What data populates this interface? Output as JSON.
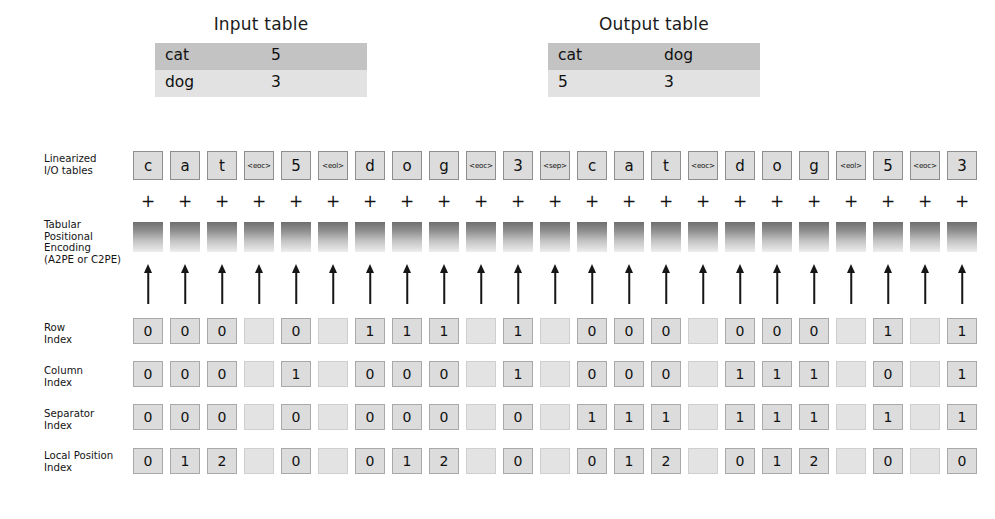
{
  "input_table": {
    "caption": "Input table",
    "header": [
      "cat",
      "5"
    ],
    "rows": [
      [
        "dog",
        "3"
      ]
    ]
  },
  "output_table": {
    "caption": "Output table",
    "header": [
      "cat",
      "dog"
    ],
    "rows": [
      [
        "5",
        "3"
      ]
    ]
  },
  "labels": {
    "linearized": "Linearized\nI/O tables",
    "tpe": "Tabular\nPositional\nEncoding\n(A2PE or C2PE)",
    "row_index": "Row\nIndex",
    "column_index": "Column\nIndex",
    "separator_index": "Separator\nIndex",
    "local_position_index": "Local Position\nIndex"
  },
  "plus_symbol": "+",
  "tokens": [
    "c",
    "a",
    "t",
    "<eoc>",
    "5",
    "<eol>",
    "d",
    "o",
    "g",
    "<eoc>",
    "3",
    "<sep>",
    "c",
    "a",
    "t",
    "<eoc>",
    "d",
    "o",
    "g",
    "<eol>",
    "5",
    "<eoc>",
    "3"
  ],
  "special_tokens": [
    "<eoc>",
    "<eol>",
    "<sep>"
  ],
  "row_index": [
    "0",
    "0",
    "0",
    "",
    "0",
    "",
    "1",
    "1",
    "1",
    "",
    "1",
    "",
    "0",
    "0",
    "0",
    "",
    "0",
    "0",
    "0",
    "",
    "1",
    "",
    "1"
  ],
  "column_index": [
    "0",
    "0",
    "0",
    "",
    "1",
    "",
    "0",
    "0",
    "0",
    "",
    "1",
    "",
    "0",
    "0",
    "0",
    "",
    "1",
    "1",
    "1",
    "",
    "0",
    "",
    "1"
  ],
  "separator_index": [
    "0",
    "0",
    "0",
    "",
    "0",
    "",
    "0",
    "0",
    "0",
    "",
    "0",
    "",
    "1",
    "1",
    "1",
    "",
    "1",
    "1",
    "1",
    "",
    "1",
    "",
    "1"
  ],
  "local_position_index": [
    "0",
    "1",
    "2",
    "",
    "0",
    "",
    "0",
    "1",
    "2",
    "",
    "0",
    "",
    "0",
    "1",
    "2",
    "",
    "0",
    "1",
    "2",
    "",
    "0",
    "",
    "0"
  ],
  "colors": {
    "token_fill": "#dcdcdc",
    "token_border": "#8e8e8e",
    "table_header_fill": "#c3c3c3",
    "table_body_fill": "#e2e2e2",
    "pe_gradient_top": "#6f6f6f",
    "pe_gradient_bottom": "#ededed",
    "arrow": "#161616"
  }
}
